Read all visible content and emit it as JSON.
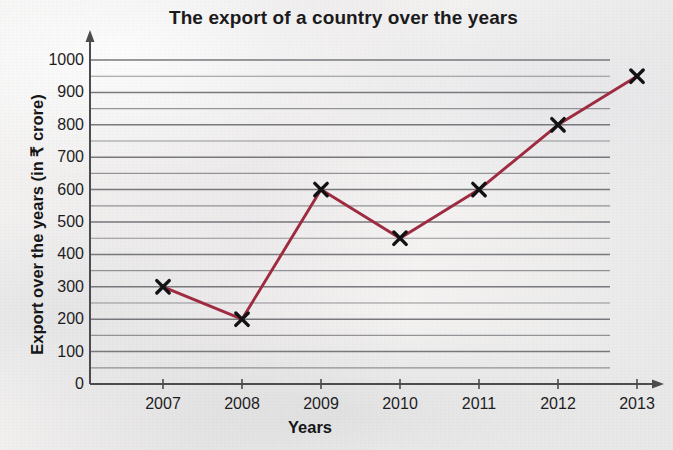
{
  "chart_data": {
    "type": "line",
    "title": "The export of a country over the years",
    "xlabel": "Years",
    "ylabel": "Export over the years (in ₹ crore)",
    "categories": [
      "2007",
      "2008",
      "2009",
      "2010",
      "2011",
      "2012",
      "2013"
    ],
    "values": [
      300,
      200,
      600,
      450,
      600,
      800,
      950
    ],
    "series": [
      {
        "name": "Export over the years",
        "values": [
          300,
          200,
          600,
          450,
          600,
          800,
          950
        ]
      }
    ],
    "points": [
      {
        "x": "2007",
        "y": 300
      },
      {
        "x": "2008",
        "y": 200
      },
      {
        "x": "2009",
        "y": 600
      },
      {
        "x": "2010",
        "y": 450
      },
      {
        "x": "2011",
        "y": 600
      },
      {
        "x": "2012",
        "y": 800
      },
      {
        "x": "2013",
        "y": 950
      }
    ],
    "ylim": [
      0,
      1000
    ],
    "ytick_labels": [
      "0",
      "100",
      "200",
      "300",
      "400",
      "500",
      "600",
      "700",
      "800",
      "900",
      "1000"
    ],
    "ytick_values": [
      0,
      100,
      200,
      300,
      400,
      500,
      600,
      700,
      800,
      900,
      1000
    ],
    "y_minor_step": 50,
    "grid": true,
    "grid_orientation": "horizontal",
    "legend": false,
    "legend_position": "none",
    "marker": "x",
    "colors": {
      "line": "#9e2b40",
      "marker": "#121214",
      "grid": "#6e6e73",
      "axis": "#4c4c50",
      "text": "#1b1b1d",
      "background": "#f1f0ee"
    }
  }
}
